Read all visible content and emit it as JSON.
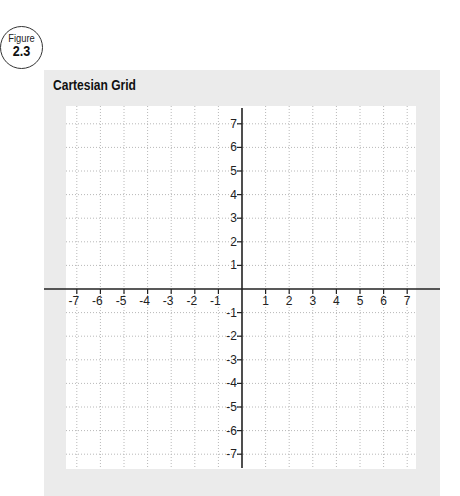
{
  "figure": {
    "label": "Figure",
    "number": "2.3"
  },
  "title": "Cartesian Grid",
  "chart_data": {
    "type": "cartesian-grid",
    "title": "Cartesian Grid",
    "x_range": [
      -7,
      7
    ],
    "y_range": [
      -7,
      7
    ],
    "x_ticks": [
      "-7",
      "-6",
      "-5",
      "-4",
      "-3",
      "-2",
      "-1",
      "1",
      "2",
      "3",
      "4",
      "5",
      "6",
      "7"
    ],
    "y_ticks": [
      "7",
      "6",
      "5",
      "4",
      "3",
      "2",
      "1",
      "-1",
      "-2",
      "-3",
      "-4",
      "-5",
      "-6",
      "-7"
    ],
    "grid": true,
    "grid_style": "dotted",
    "series": []
  },
  "colors": {
    "panel": "#ebebeb",
    "plot": "#ffffff",
    "grid": "#b8b8b8",
    "axis": "#222222"
  }
}
